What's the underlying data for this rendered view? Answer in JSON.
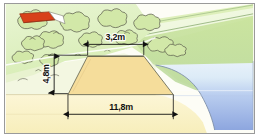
{
  "diagram": {
    "type": "technical-illustration",
    "dimensions": [
      {
        "id": "crest_width",
        "label": "3,2m",
        "value": 3.2,
        "unit": "m",
        "orientation": "horizontal",
        "position": "top"
      },
      {
        "id": "height",
        "label": "4,8m",
        "value": 4.8,
        "unit": "m",
        "orientation": "vertical",
        "position": "left"
      },
      {
        "id": "base_width",
        "label": "11,8m",
        "value": 11.8,
        "unit": "m",
        "orientation": "horizontal",
        "position": "bottom"
      }
    ],
    "scene_elements": [
      {
        "id": "embankment",
        "name": "earth-dam-body"
      },
      {
        "id": "vegetation",
        "name": "tree-canopy-area"
      },
      {
        "id": "building",
        "name": "red-roof-building"
      },
      {
        "id": "hillside",
        "name": "green-hillside"
      },
      {
        "id": "water",
        "name": "water-reservoir"
      },
      {
        "id": "ground",
        "name": "ground-foreground"
      }
    ],
    "colors": {
      "embankment_fill": "#f5dd9b",
      "embankment_stroke": "#6c6c5a",
      "ground_fill": "#fbf4cc",
      "hillside_fill": "#d9efb0",
      "hillside_dark": "#c3e096",
      "hillside_edge": "#7d9e6a",
      "water_top": "#dcebf7",
      "water_bottom": "#8fa8e0",
      "tree_stroke": "#4a4a42",
      "tree_fill": "#cfe6a6",
      "roof_red": "#d8401a",
      "paper": "#fdfdf6",
      "frame_border": "#9a9a9a",
      "dimension_line": "#111111",
      "label_text": "#111111"
    }
  }
}
